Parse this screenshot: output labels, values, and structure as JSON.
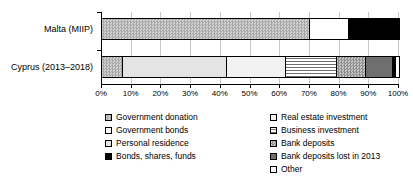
{
  "chart_data": {
    "type": "bar",
    "orientation": "horizontal",
    "stacked": true,
    "normalized": true,
    "title": "",
    "xlabel": "",
    "ylabel": "",
    "xlim": [
      0,
      100
    ],
    "grid": true,
    "legend_position": "bottom",
    "categories": [
      "Malta (MIIP)",
      "Cyprus (2013–2018)"
    ],
    "xtick_labels": [
      "0%",
      "10%",
      "20%",
      "30%",
      "40%",
      "50%",
      "60%",
      "70%",
      "80%",
      "90%",
      "100%"
    ],
    "xticks": [
      0,
      10,
      20,
      30,
      40,
      50,
      60,
      70,
      80,
      90,
      100
    ],
    "series": [
      {
        "name": "Government donation",
        "key": "gov-donation",
        "pattern": "checkerboard-gray",
        "values": [
          70,
          7
        ]
      },
      {
        "name": "Government bonds",
        "key": "gov-bonds",
        "pattern": "white",
        "values": [
          13,
          0
        ]
      },
      {
        "name": "Personal residence",
        "key": "personal-residence",
        "pattern": "light-gray",
        "values": [
          0,
          35
        ]
      },
      {
        "name": "Bonds, shares, funds",
        "key": "bonds-shares",
        "pattern": "solid-black",
        "values": [
          17,
          1
        ]
      },
      {
        "name": "Real estate investment",
        "key": "real-estate",
        "pattern": "very-light-gray",
        "values": [
          0,
          20
        ]
      },
      {
        "name": "Business investment",
        "key": "business",
        "pattern": "horizontal-lines",
        "values": [
          0,
          17
        ]
      },
      {
        "name": "Bank deposits",
        "key": "bank-deposits",
        "pattern": "checkerboard-medium",
        "values": [
          0,
          10
        ]
      },
      {
        "name": "Bank deposits lost in 2013",
        "key": "bank-lost",
        "pattern": "dark-gray",
        "values": [
          0,
          9
        ]
      },
      {
        "name": "Other",
        "key": "other",
        "pattern": "white-outline",
        "values": [
          0,
          1
        ]
      }
    ],
    "bars": [
      {
        "category": "Malta (MIIP)",
        "segments": [
          {
            "label": "Government donation",
            "key": "gov-donation",
            "value": 70
          },
          {
            "label": "Government bonds",
            "key": "gov-bonds",
            "value": 13
          },
          {
            "label": "Bonds, shares, funds",
            "key": "bonds-shares",
            "value": 17
          }
        ]
      },
      {
        "category": "Cyprus (2013–2018)",
        "segments": [
          {
            "label": "Government donation",
            "key": "gov-donation",
            "value": 7
          },
          {
            "label": "Personal residence",
            "key": "personal-residence",
            "value": 35
          },
          {
            "label": "Real estate investment",
            "key": "real-estate",
            "value": 20
          },
          {
            "label": "Business investment",
            "key": "business",
            "value": 17
          },
          {
            "label": "Bank deposits",
            "key": "bank-deposits",
            "value": 10
          },
          {
            "label": "Bank deposits lost in 2013",
            "key": "bank-lost",
            "value": 9
          },
          {
            "label": "Bonds, shares, funds",
            "key": "bonds-shares",
            "value": 1
          },
          {
            "label": "Other",
            "key": "other",
            "value": 1
          }
        ]
      }
    ]
  },
  "legend": {
    "left_column": [
      {
        "label": "Government donation",
        "key": "gov-donation"
      },
      {
        "label": "Government bonds",
        "key": "gov-bonds"
      },
      {
        "label": "Personal residence",
        "key": "personal-residence"
      },
      {
        "label": "Bonds, shares, funds",
        "key": "bonds-shares"
      }
    ],
    "right_column": [
      {
        "label": "Real estate investment",
        "key": "real-estate"
      },
      {
        "label": "Business investment",
        "key": "business"
      },
      {
        "label": "Bank deposits",
        "key": "bank-deposits"
      },
      {
        "label": "Bank deposits lost in 2013",
        "key": "bank-lost"
      },
      {
        "label": "Other",
        "key": "other"
      }
    ]
  }
}
